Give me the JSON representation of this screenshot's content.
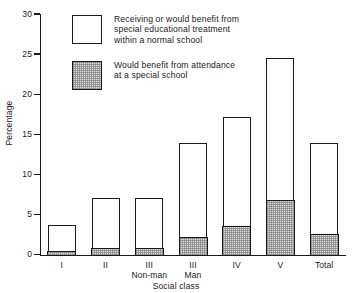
{
  "chart_data": {
    "type": "bar",
    "title": "",
    "xlabel": "Social class",
    "ylabel": "Percentage",
    "ylim": [
      0,
      30
    ],
    "ytick_labels": [
      "0",
      "5",
      "10",
      "15",
      "20",
      "25",
      "30"
    ],
    "ytick_values": [
      0,
      5,
      10,
      15,
      20,
      25,
      30
    ],
    "grid": false,
    "stacked": true,
    "legend_position": "upper-left-inside",
    "categories": [
      "I",
      "II",
      "III",
      "III",
      "IV",
      "V",
      "Total"
    ],
    "category_sublabels": [
      "",
      "",
      "Non-man",
      "Man",
      "",
      "",
      ""
    ],
    "series": [
      {
        "name": "Would benefit from attendance at a special school",
        "values": [
          0.4,
          0.7,
          0.75,
          2.1,
          3.5,
          6.7,
          2.5
        ]
      },
      {
        "name": "Receiving or would benefit from special educational treatment within a normal school",
        "values": [
          3.35,
          6.4,
          6.4,
          11.9,
          13.75,
          17.9,
          11.5
        ]
      }
    ],
    "totals": [
      3.75,
      7.1,
      7.15,
      14.0,
      17.25,
      24.6,
      14.0
    ]
  },
  "legend": {
    "items": [
      {
        "label": "Receiving or would benefit from\nspecial educational treatment\nwithin a normal school",
        "swatch": "open"
      },
      {
        "label": "Would benefit from attendance\nat a special school",
        "swatch": "shaded"
      }
    ]
  },
  "axes": {
    "y_title": "Percentage",
    "x_title": "Social class"
  },
  "colors": {
    "line": "#1a1a1a",
    "open_fill": "#ffffff",
    "shaded_fill": "#dcdcdc",
    "background": "#ffffff"
  }
}
